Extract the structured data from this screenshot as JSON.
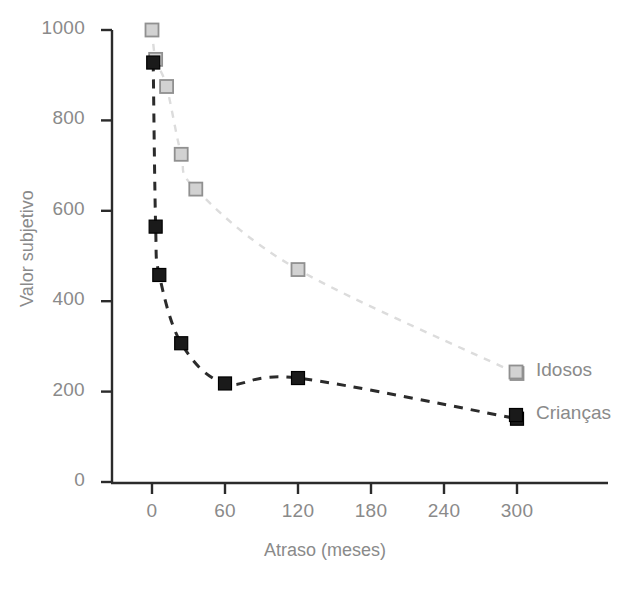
{
  "chart_data": {
    "type": "scatter",
    "title": "",
    "xlabel": "Atraso (meses)",
    "ylabel": "Valor subjetivo",
    "xlim": [
      0,
      330
    ],
    "ylim": [
      0,
      1000
    ],
    "xticks": [
      "0",
      "60",
      "120",
      "180",
      "240",
      "300"
    ],
    "xtick_values": [
      0,
      60,
      120,
      180,
      240,
      300
    ],
    "yticks": [
      "0",
      "200",
      "400",
      "600",
      "800",
      "1000"
    ],
    "ytick_values": [
      0,
      200,
      400,
      600,
      800,
      1000
    ],
    "grid": false,
    "legend_position": "right-inside",
    "series": [
      {
        "name": "Idosos",
        "marker": "square-open",
        "color": "#bdbdbd",
        "edge_color": "#909090",
        "line_style": "dashed",
        "line_color": "#dcdcdc",
        "x": [
          0,
          3,
          12,
          24,
          36,
          120,
          300
        ],
        "y": [
          1000,
          935,
          875,
          725,
          648,
          470,
          240
        ]
      },
      {
        "name": "Crianças",
        "marker": "square-filled",
        "color": "#1a1a1a",
        "edge_color": "#000000",
        "line_style": "dashed",
        "line_color": "#2b2b2b",
        "x": [
          1,
          3,
          6,
          24,
          60,
          120,
          300
        ],
        "y": [
          928,
          565,
          458,
          307,
          218,
          230,
          140
        ]
      }
    ]
  },
  "legend": {
    "items": [
      {
        "label": "Idosos",
        "marker": "square-open",
        "color": "#bdbdbd"
      },
      {
        "label": "Crianças",
        "marker": "square-filled",
        "color": "#1a1a1a"
      }
    ]
  },
  "axis": {
    "x_title": "Atraso (meses)",
    "y_title": "Valor subjetivo"
  },
  "colors": {
    "background": "#ffffff",
    "axis_line": "#2b2b2b",
    "tick_text": "#8a8a8a",
    "series_idosos": "#bdbdbd",
    "series_criancas": "#1a1a1a"
  }
}
